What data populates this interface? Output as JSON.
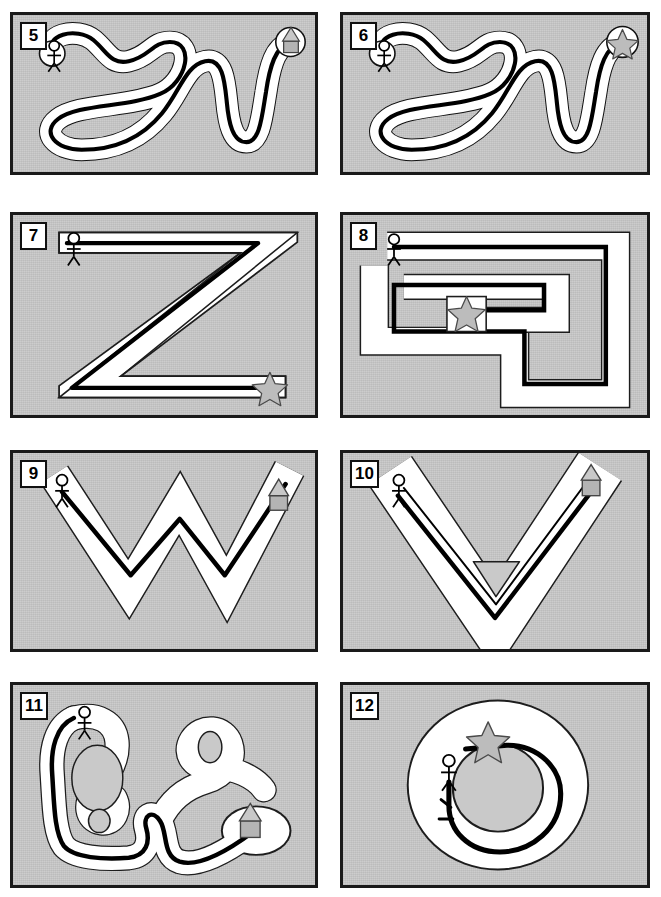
{
  "page": {
    "background_color": "#ffffff",
    "panel_background_color": "#c9c9c9",
    "panel_border_color": "#1a1a1a",
    "path_color": "#000000",
    "corridor_color": "#ffffff",
    "icon_fill_color": "#b4b4b4",
    "icon_stroke_color": "#555555",
    "columns": 2,
    "rows": 4,
    "width": 661,
    "height": 897
  },
  "panels": [
    {
      "number": "5",
      "shape_name": "winding-serpentine-maze",
      "start_icon": "stick-figure-icon",
      "goal_icon": "house-icon",
      "path_drawn": true,
      "path_complete": true,
      "description": "Curvy looping snake-like corridor from stick figure at upper-left to house at upper-right"
    },
    {
      "number": "6",
      "shape_name": "winding-serpentine-maze",
      "start_icon": "stick-figure-icon",
      "goal_icon": "star-icon",
      "path_drawn": true,
      "path_complete": true,
      "description": "Same serpentine corridor as panel 5 but goal is a star at upper-right"
    },
    {
      "number": "7",
      "shape_name": "letter-z-maze",
      "start_icon": "stick-figure-icon",
      "goal_icon": "star-icon",
      "path_drawn": true,
      "path_complete": true,
      "description": "Large letter Z shaped corridor, figure at top-left, star at bottom-right"
    },
    {
      "number": "8",
      "shape_name": "rectangular-spiral-maze",
      "start_icon": "stick-figure-icon",
      "goal_icon": "star-icon",
      "path_drawn": true,
      "path_complete": true,
      "description": "Rectangular spiral corridor, figure at top-left, star in the centre"
    },
    {
      "number": "9",
      "shape_name": "letter-w-zigzag-maze",
      "start_icon": "stick-figure-icon",
      "goal_icon": "house-icon",
      "path_drawn": true,
      "path_complete": true,
      "description": "W shaped zigzag corridor, figure at upper-left, house at upper-right"
    },
    {
      "number": "10",
      "shape_name": "letter-v-maze",
      "start_icon": "stick-figure-icon",
      "goal_icon": "house-icon",
      "path_drawn": true,
      "path_complete": true,
      "description": "V shaped corridor with triangular island obstacle, figure at upper-left, house at upper-right"
    },
    {
      "number": "11",
      "shape_name": "branching-blob-maze",
      "start_icon": "stick-figure-icon",
      "goal_icon": "house-icon",
      "path_drawn": true,
      "path_complete": true,
      "description": "Irregular blob corridor with dead-end branches, figure at top-left, house at lower-right"
    },
    {
      "number": "12",
      "shape_name": "circular-ring-maze",
      "start_icon": "stick-figure-icon",
      "goal_icon": "star-icon",
      "path_drawn": true,
      "path_complete": false,
      "description": "Ring / donut corridor, figure inside the ring at left, star at top; path loops around"
    }
  ]
}
